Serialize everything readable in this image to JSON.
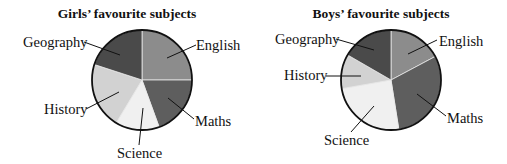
{
  "chart_data": [
    {
      "type": "pie",
      "title": "Girls’ favourite subjects",
      "categories": [
        "English",
        "Maths",
        "Science",
        "History",
        "Geography"
      ],
      "values_degrees": [
        90,
        70,
        51,
        77,
        72
      ],
      "start_angle": 90,
      "direction": "clockwise",
      "colors": [
        "#8c8c8c",
        "#5e5e5e",
        "#f0f0f0",
        "#d2d2d2",
        "#4a4a4a"
      ],
      "legend": "none (leader-line labels)"
    },
    {
      "type": "pie",
      "title": "Boys’ favourite subjects",
      "categories": [
        "English",
        "Maths",
        "Science",
        "History",
        "Geography"
      ],
      "values_degrees": [
        62,
        109,
        89,
        40,
        60
      ],
      "start_angle": 90,
      "direction": "clockwise",
      "colors": [
        "#8c8c8c",
        "#5e5e5e",
        "#f0f0f0",
        "#d2d2d2",
        "#4a4a4a"
      ],
      "legend": "none (leader-line labels)"
    }
  ],
  "charts": [
    {
      "title": "Girls’ favourite subjects",
      "labels": {
        "english": "English",
        "maths": "Maths",
        "science": "Science",
        "history": "History",
        "geography": "Geography"
      }
    },
    {
      "title": "Boys’ favourite subjects",
      "labels": {
        "english": "English",
        "maths": "Maths",
        "science": "Science",
        "history": "History",
        "geography": "Geography"
      }
    }
  ]
}
